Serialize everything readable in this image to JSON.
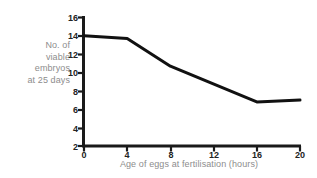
{
  "chart_data": {
    "type": "line",
    "title": "",
    "xlabel": "Age of eggs at fertilisation (hours)",
    "ylabel": "No. of\nviable\nembryos\nat 25 days",
    "x": [
      0,
      4,
      8,
      16,
      20
    ],
    "values": [
      14.0,
      13.7,
      10.7,
      6.8,
      7.0
    ],
    "series": [
      {
        "name": "No. of viable embryos at 25 days",
        "values": [
          14.0,
          13.7,
          10.7,
          6.8,
          7.0
        ]
      }
    ],
    "xlim": [
      0,
      20
    ],
    "ylim": [
      2,
      16
    ],
    "xticks": [
      "0",
      "4",
      "8",
      "12",
      "16",
      "20"
    ],
    "yticks": [
      "16",
      "14",
      "12",
      "10",
      "8",
      "6",
      "4",
      "2"
    ],
    "grid": false,
    "legend": false,
    "line_color": "#111111",
    "axis_color": "#1a1a1a",
    "tick_label_color": "#232323",
    "axis_title_color": "#8d8d8d",
    "background": "#ffffff"
  }
}
